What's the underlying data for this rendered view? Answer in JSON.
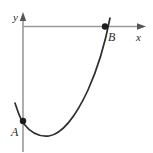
{
  "figure": {
    "kind": "coordinate-plane-curve-diagram",
    "background_color": "#ffffff"
  },
  "axes": {
    "x_axis": {
      "label": "x",
      "label_x": 136,
      "label_y": 41,
      "font_size": 11,
      "line_color": "#9a9a9a",
      "line_width": 1.6,
      "x_start": 23,
      "x_end": 141,
      "y": 26.5,
      "arrow": "right-arrow-head",
      "arrow_tip_x": 146,
      "arrow_tip_y": 26.5
    },
    "y_axis": {
      "label": "y",
      "label_x": 13,
      "label_y": 21,
      "font_size": 11,
      "line_color": "#9a9a9a",
      "line_width": 1.6,
      "x": 23,
      "y_start": 152,
      "y_end": 17,
      "arrow": "up-arrow-head",
      "arrow_tip_x": 23,
      "arrow_tip_y": 12
    }
  },
  "curve": {
    "name": "parabola",
    "color": "#2f2f2f",
    "width": 1.7,
    "path": "M 15 103 C 18 112, 20 119, 24 124 C 31 133, 40 137, 49 136 C 62 134, 76 116, 88 90 C 97 70, 105 44, 110 18",
    "vertex_x": 48,
    "vertex_y": 136
  },
  "points": [
    {
      "id": "A",
      "label": "A",
      "cx": 23,
      "cy": 121,
      "r": 3.2,
      "color": "#1d1d1d",
      "label_x": 11,
      "label_y": 136,
      "font_size": 12
    },
    {
      "id": "B",
      "label": "B",
      "cx": 105,
      "cy": 26.5,
      "r": 3.2,
      "color": "#1d1d1d",
      "label_x": 108,
      "label_y": 41,
      "font_size": 12
    }
  ]
}
